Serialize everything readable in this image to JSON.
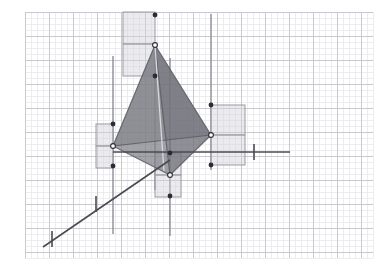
{
  "canvas": {
    "width": 385,
    "height": 271,
    "background": "#ffffff",
    "title": "3D tetrahedron with axis grid"
  },
  "grid": {
    "minor_spacing": 6,
    "major_spacing": 24,
    "minor_color": "#e9e9ec",
    "major_color": "#c9c9cf",
    "x_start": 25,
    "x_end": 373,
    "y_start": 12,
    "y_end": 258
  },
  "axes": {
    "color": "#4a4a52",
    "width": 1.6,
    "items": [
      {
        "name": "x-axis-horizontal",
        "x1": 113,
        "y1": 152,
        "x2": 290,
        "y2": 152,
        "tick_at": 254,
        "tick_half": 8
      },
      {
        "name": "z-axis-diagonal",
        "x1": 43,
        "y1": 247,
        "x2": 170,
        "y2": 160,
        "tick1_x": 52,
        "tick1_y": 247,
        "tick2_x": 96,
        "tick2_y": 212
      }
    ]
  },
  "vertical_lines": {
    "color": "#8d8d98",
    "width": 1.4,
    "items": [
      {
        "name": "vline-left",
        "x": 113,
        "y1": 56,
        "y2": 234
      },
      {
        "name": "vline-mid",
        "x": 155,
        "y1": 60,
        "y2": 190
      },
      {
        "name": "vline-bottom",
        "x": 170,
        "y1": 58,
        "y2": 236
      },
      {
        "name": "vline-right",
        "x": 211,
        "y1": 14,
        "y2": 170
      }
    ]
  },
  "tetrahedron": {
    "name": "tetrahedron",
    "apex": {
      "x": 155,
      "y": 45
    },
    "left": {
      "x": 113,
      "y": 146
    },
    "right": {
      "x": 211,
      "y": 135
    },
    "bottom": {
      "x": 170,
      "y": 175
    },
    "face_front_color": "#7e7e86",
    "face_front_opacity": 0.72,
    "face_left_color": "#8e8e96",
    "face_left_opacity": 0.62,
    "face_lower_color": "#6f6f78",
    "face_lower_opacity": 0.78,
    "edge_color": "#5a5a63",
    "edge_light_color": "#d8d8dc"
  },
  "squares": {
    "fill": "#d3d3d8",
    "fill_opacity": 0.45,
    "stroke": "#9a9aa2",
    "items": [
      {
        "name": "square-top",
        "x": 123,
        "y": 12,
        "w": 32,
        "h": 32
      },
      {
        "name": "square-top-lower",
        "x": 123,
        "y": 44,
        "w": 32,
        "h": 32
      },
      {
        "name": "square-left-upper",
        "x": 96,
        "y": 124,
        "w": 17,
        "h": 22
      },
      {
        "name": "square-left-lower",
        "x": 96,
        "y": 146,
        "w": 17,
        "h": 22
      },
      {
        "name": "square-right-upper",
        "x": 211,
        "y": 105,
        "w": 34,
        "h": 30
      },
      {
        "name": "square-right-lower",
        "x": 211,
        "y": 135,
        "w": 34,
        "h": 30
      },
      {
        "name": "square-bottom-up",
        "x": 155,
        "y": 153,
        "w": 26,
        "h": 22
      },
      {
        "name": "square-bottom-low",
        "x": 155,
        "y": 175,
        "w": 26,
        "h": 22
      }
    ]
  },
  "points": {
    "filled_color": "#2b2b33",
    "hollow_fill": "#ffffff",
    "hollow_stroke": "#2b2b33",
    "radius": 2.4,
    "items": [
      {
        "name": "point-top-filled",
        "x": 155,
        "y": 15,
        "style": "filled"
      },
      {
        "name": "point-apex-hollow",
        "x": 155,
        "y": 45,
        "style": "hollow"
      },
      {
        "name": "point-top-below",
        "x": 155,
        "y": 76,
        "style": "filled"
      },
      {
        "name": "point-left-above",
        "x": 113,
        "y": 124,
        "style": "filled"
      },
      {
        "name": "point-left-hollow",
        "x": 113,
        "y": 146,
        "style": "hollow"
      },
      {
        "name": "point-left-below",
        "x": 113,
        "y": 166,
        "style": "filled"
      },
      {
        "name": "point-right-above",
        "x": 211,
        "y": 105,
        "style": "filled"
      },
      {
        "name": "point-right-hollow",
        "x": 211,
        "y": 135,
        "style": "hollow"
      },
      {
        "name": "point-right-below",
        "x": 211,
        "y": 165,
        "style": "filled"
      },
      {
        "name": "point-bottom-above",
        "x": 170,
        "y": 153,
        "style": "filled"
      },
      {
        "name": "point-bottom-hollow",
        "x": 170,
        "y": 175,
        "style": "hollow"
      },
      {
        "name": "point-bottom-below",
        "x": 170,
        "y": 196,
        "style": "filled"
      }
    ]
  },
  "chart_data": {
    "type": "scatter",
    "xlabel": "",
    "ylabel": "",
    "annotations": [
      "Four vertices joined by solid edges forming a shaded tetrahedron",
      "Each vertex carries a pair of stacked translucent unit squares",
      "Vertical guide lines drop from every vertex",
      "Horizontal x-axis and diagonal depth axis with tick marks"
    ],
    "x": [
      155,
      113,
      211,
      170
    ],
    "y": [
      45,
      146,
      135,
      175
    ],
    "series": [
      {
        "name": "vertices",
        "values": [
          45,
          146,
          135,
          175
        ]
      }
    ],
    "categories": [
      "apex",
      "left",
      "right",
      "bottom"
    ],
    "grid": true,
    "legend": "none"
  }
}
